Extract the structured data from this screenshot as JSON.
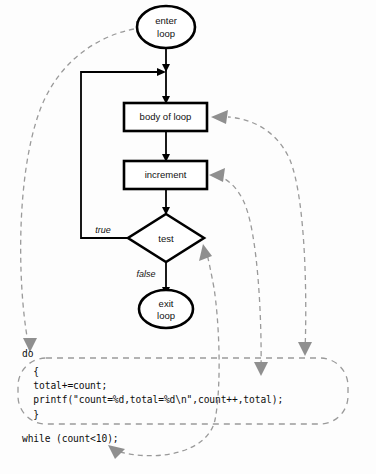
{
  "diagram": {
    "nodes": [
      {
        "id": "enter",
        "shape": "terminator",
        "line1": "enter",
        "line2": "loop"
      },
      {
        "id": "body",
        "shape": "process",
        "line1": "body of loop",
        "line2": ""
      },
      {
        "id": "increment",
        "shape": "process",
        "line1": "increment",
        "line2": ""
      },
      {
        "id": "test",
        "shape": "decision",
        "line1": "test",
        "line2": ""
      },
      {
        "id": "exit",
        "shape": "terminator",
        "line1": "exit",
        "line2": "loop"
      }
    ],
    "edge_labels": {
      "true": "true",
      "false": "false"
    },
    "colors": {
      "flow_stroke": "#000000",
      "mapping_stroke": "#9a9a9a",
      "arrowhead": "#8f8f8f",
      "background": "#fdfdfd",
      "text": "#111111"
    }
  },
  "code": {
    "lines": [
      "do",
      "  {",
      "  total+=count;",
      "  printf(\"count=%d,total=%d\\n\",count++,total);",
      "  }",
      "while (count<10);"
    ],
    "line_do": "do",
    "line_open_brace": "  {",
    "line_total": "  total+=count;",
    "line_printf": "  printf(\"count=%d,total=%d\\n\",count++,total);",
    "line_close_brace": "  }",
    "line_while": "while (count<10);"
  },
  "mappings": [
    {
      "from": "do",
      "to": "enter loop"
    },
    {
      "from": "loop body block",
      "to": "body of loop"
    },
    {
      "from": "count++ in printf",
      "to": "increment"
    },
    {
      "from": "while (count<10)",
      "to": "test"
    }
  ]
}
